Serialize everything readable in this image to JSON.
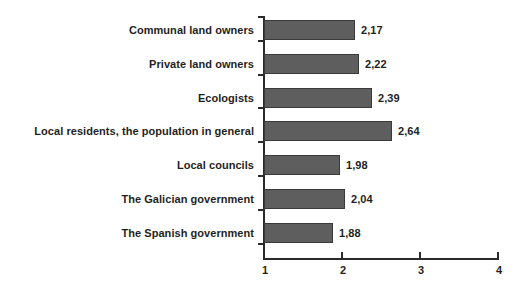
{
  "chart_data": {
    "type": "bar",
    "orientation": "horizontal",
    "title": "",
    "subtitle": "",
    "xlabel": "",
    "ylabel": "",
    "xlim": [
      1,
      4
    ],
    "grid": false,
    "legend": null,
    "value_label_format": "comma-decimal",
    "bar_color": "#5e5e5e",
    "bar_border_color": "#3a3a3a",
    "axis_color": "#2b2b2b",
    "background_color": "#ffffff",
    "xticks": [
      "1",
      "2",
      "3",
      "4"
    ],
    "xtick_values": [
      1,
      2,
      3,
      4
    ],
    "categories": [
      "Communal land owners",
      "Private land owners",
      "Ecologists",
      "Local residents, the population in general",
      "Local councils",
      "The Galician government",
      "The Spanish government"
    ],
    "values": [
      2.17,
      2.22,
      2.39,
      2.64,
      1.98,
      2.04,
      1.88
    ],
    "value_labels": [
      "2,17",
      "2,22",
      "2,39",
      "2,64",
      "1,98",
      "2,04",
      "1,88"
    ]
  }
}
